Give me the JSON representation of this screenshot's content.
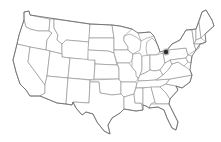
{
  "map": {
    "subject": "United States (contiguous) state outline map",
    "background_color": "#ffffff",
    "border_color": "#8a8a8a",
    "coast_color": "#6e6e6e",
    "marker": {
      "icon": "location-dot-icon",
      "region": "Michigan / Detroit area",
      "x": 166,
      "y": 52,
      "color": "#2a2a2a"
    }
  }
}
